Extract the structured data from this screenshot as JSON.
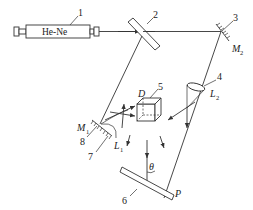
{
  "diagram": {
    "type": "optical-interferometer-setup",
    "source": {
      "number": "1",
      "label": "He-Ne"
    },
    "components": [
      {
        "number": "1",
        "name": "He-Ne laser"
      },
      {
        "number": "2",
        "name": "beam splitter"
      },
      {
        "number": "3",
        "name": "mirror",
        "symbol": "M",
        "subscript": "2"
      },
      {
        "number": "4",
        "name": "lens",
        "symbol": "L",
        "subscript": "2"
      },
      {
        "number": "5",
        "name": "cube",
        "symbol": "D"
      },
      {
        "number": "6",
        "name": "plate",
        "symbol": "P"
      },
      {
        "number": "7",
        "name": "lens",
        "symbol": "L",
        "subscript": "1"
      },
      {
        "number": "8",
        "name": "mirror",
        "symbol": "M",
        "subscript": "1"
      }
    ],
    "angle_label": "θ",
    "labels": {
      "n1": "1",
      "n2": "2",
      "n3": "3",
      "n4": "4",
      "n5": "5",
      "n6": "6",
      "n7": "7",
      "n8": "8",
      "M": "M",
      "L": "L",
      "D": "D",
      "P": "P",
      "sub1": "1",
      "sub2": "2",
      "theta": "θ"
    },
    "colors": {
      "line": "#333333",
      "background": "#ffffff"
    }
  }
}
